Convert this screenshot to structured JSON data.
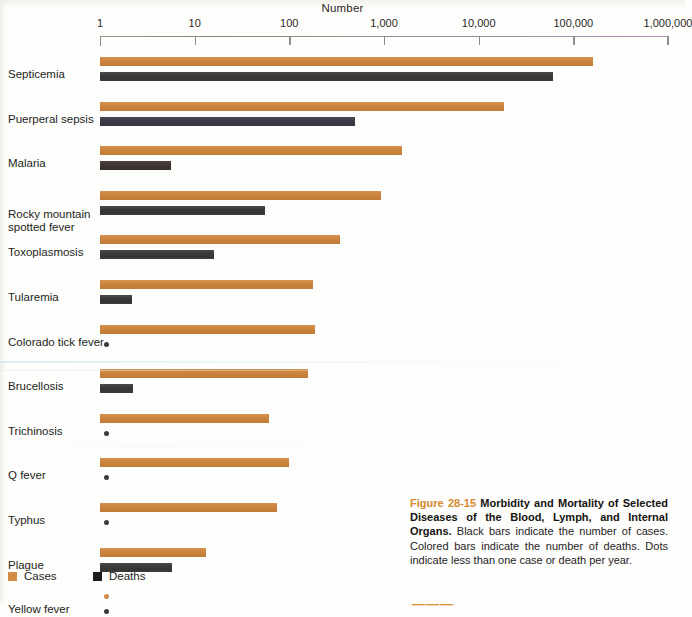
{
  "chart_data": {
    "type": "bar",
    "orientation": "horizontal",
    "title": "Number",
    "xlabel": "Number",
    "ylabel": "",
    "scale": "log10",
    "xlim": [
      1,
      1000000
    ],
    "grid": false,
    "tick_labels": [
      "1",
      "10",
      "100",
      "1,000",
      "10,000",
      "100,000",
      "1,000,000"
    ],
    "tick_values": [
      1,
      10,
      100,
      1000,
      10000,
      100000,
      1000000
    ],
    "legend_position": "bottom-left",
    "categories": [
      "Septicemia",
      "Puerperal sepsis",
      "Malaria",
      "Rocky mountain\nspotted fever",
      "Toxoplasmosis",
      "Tularemia",
      "Colorado tick fever",
      "Brucellosis",
      "Trichinosis",
      "Q fever",
      "Typhus",
      "Plague",
      "Yellow fever"
    ],
    "series": [
      {
        "name": "Cases",
        "color": "#d28c46",
        "values": [
          340000,
          20000,
          2100,
          1150,
          530,
          240,
          250,
          190,
          150,
          110,
          75,
          13,
          0.5
        ]
      },
      {
        "name": "Deaths",
        "color": "#1d1d1c",
        "values": [
          58000,
          590,
          5.4,
          56,
          15,
          2.2,
          0.5,
          2.2,
          0.5,
          0.5,
          0.5,
          5.7,
          0.5
        ]
      }
    ],
    "notes": "Dots indicate less than one case or death per year."
  },
  "axis": {
    "title": "Number",
    "ticks": [
      {
        "label": "1",
        "x": 0
      },
      {
        "label": "10",
        "x": 94.7
      },
      {
        "label": "100",
        "x": 189.3
      },
      {
        "label": "1,000",
        "x": 284.0
      },
      {
        "label": "10,000",
        "x": 378.7
      },
      {
        "label": "100,000",
        "x": 473.3
      },
      {
        "label": "1,000,000",
        "x": 568.0
      }
    ]
  },
  "rows": [
    {
      "label": "Septicemia",
      "cases_w": 493,
      "deaths_w": 453,
      "cases_dot": false,
      "deaths_dot": false,
      "deaths_tint": ""
    },
    {
      "label": "Puerperal sepsis",
      "cases_w": 404,
      "deaths_w": 255,
      "cases_dot": false,
      "deaths_dot": false,
      "deaths_tint": "tint-violet"
    },
    {
      "label": "Malaria",
      "cases_w": 302,
      "deaths_w": 71,
      "cases_dot": false,
      "deaths_dot": false,
      "deaths_tint": "tint-warm"
    },
    {
      "label": "Rocky mountain\nspotted fever",
      "cases_w": 281,
      "deaths_w": 165,
      "cases_dot": false,
      "deaths_dot": false,
      "deaths_tint": ""
    },
    {
      "label": "Toxoplasmosis",
      "cases_w": 240,
      "deaths_w": 114,
      "cases_dot": false,
      "deaths_dot": false,
      "deaths_tint": ""
    },
    {
      "label": "Tularemia",
      "cases_w": 213,
      "deaths_w": 32,
      "cases_dot": false,
      "deaths_dot": false,
      "deaths_tint": ""
    },
    {
      "label": "Colorado tick fever",
      "cases_w": 215,
      "deaths_w": 0,
      "cases_dot": false,
      "deaths_dot": true,
      "deaths_tint": ""
    },
    {
      "label": "Brucellosis",
      "cases_w": 208,
      "deaths_w": 33,
      "cases_dot": false,
      "deaths_dot": false,
      "deaths_tint": ""
    },
    {
      "label": "Trichinosis",
      "cases_w": 169,
      "deaths_w": 0,
      "cases_dot": false,
      "deaths_dot": true,
      "deaths_tint": ""
    },
    {
      "label": "Q fever",
      "cases_w": 189,
      "deaths_w": 0,
      "cases_dot": false,
      "deaths_dot": true,
      "deaths_tint": ""
    },
    {
      "label": "Typhus",
      "cases_w": 177,
      "deaths_w": 0,
      "cases_dot": false,
      "deaths_dot": true,
      "deaths_tint": "tint-violet"
    },
    {
      "label": "Plague",
      "cases_w": 106,
      "deaths_w": 72,
      "cases_dot": false,
      "deaths_dot": false,
      "deaths_tint": ""
    },
    {
      "label": "Yellow fever",
      "cases_w": 0,
      "deaths_w": 0,
      "cases_dot": true,
      "deaths_dot": true,
      "deaths_tint": ""
    }
  ],
  "legend": {
    "cases_label": "Cases",
    "deaths_label": "Deaths"
  },
  "caption": {
    "figure_number": "Figure 28-15",
    "bold_title": "Morbidity and Mortality of Selected Diseases of the Blood, Lymph, and Internal Organs.",
    "body": "Black bars indicate the number of cases. Colored bars indicate the number of deaths. Dots indicate less than one case or death per year."
  },
  "bottom_mark": "———"
}
